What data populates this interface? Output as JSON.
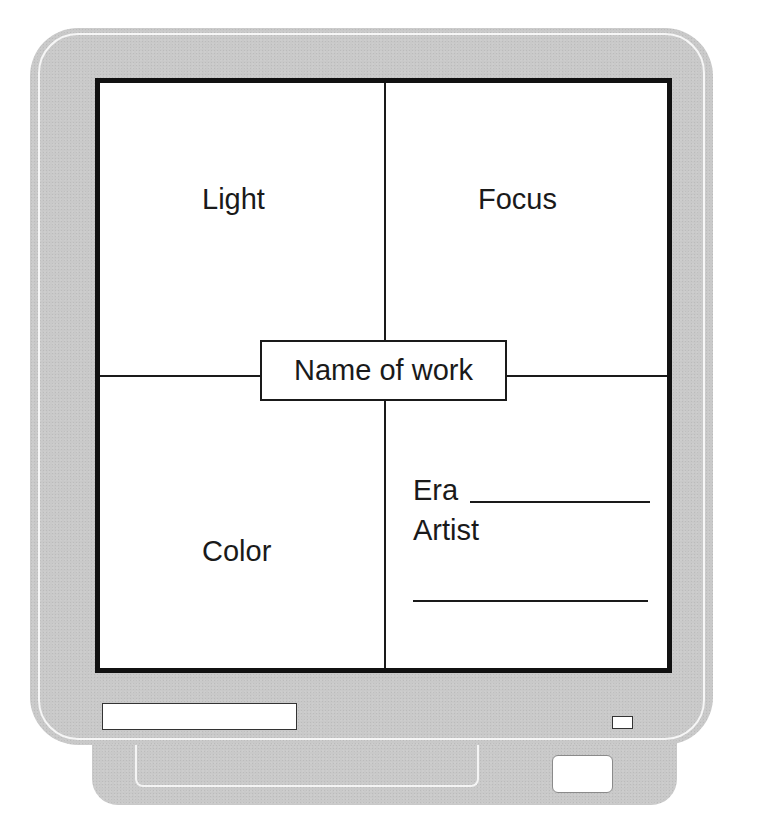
{
  "organizer": {
    "title": "Name of work",
    "quadrants": {
      "top_left": "Light",
      "top_right": "Focus",
      "bottom_left": "Color"
    },
    "info": {
      "era_label": "Era",
      "artist_label": "Artist"
    }
  },
  "monitor": {
    "bezel_color": "#c9c9c9",
    "frame_color": "#111111",
    "screen_color": "#ffffff"
  }
}
